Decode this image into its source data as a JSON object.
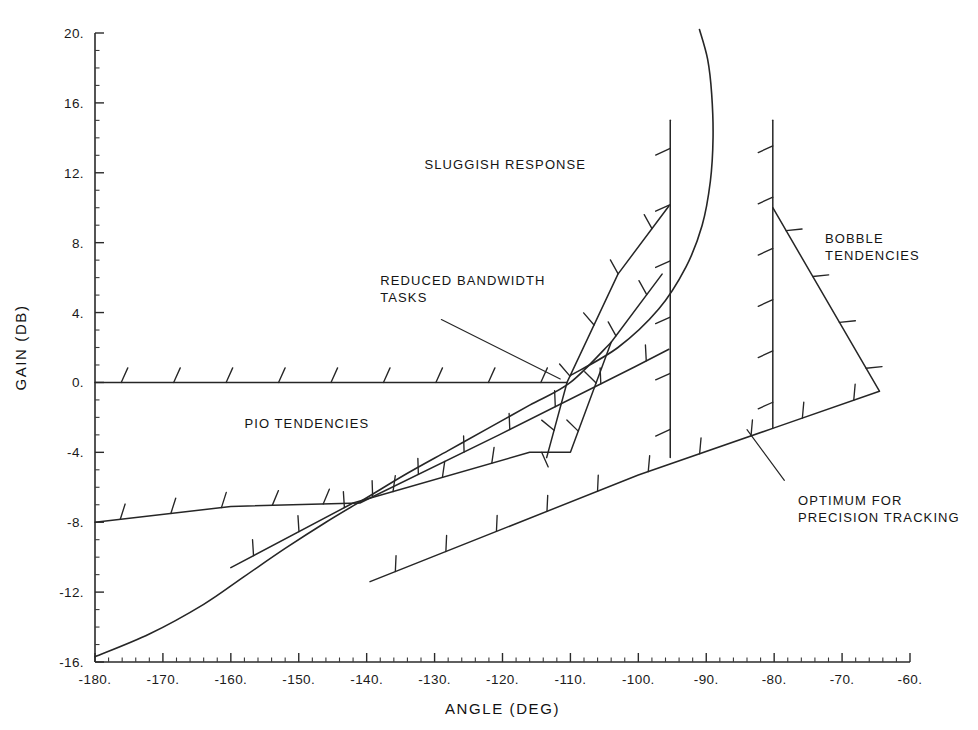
{
  "figure": {
    "background": "#ffffff",
    "ink_color": "#262626"
  },
  "chart_data": {
    "type": "line",
    "title": "",
    "subtitle": "",
    "xlabel": "ANGLE (DEG)",
    "ylabel": "GAIN (DB)",
    "xlim": [
      -180,
      -60
    ],
    "ylim": [
      -16,
      20
    ],
    "grid": false,
    "legend_position": "none",
    "x_tick_labels": [
      "-180.",
      "-170.",
      "-160.",
      "-150.",
      "-140.",
      "-130.",
      "-120.",
      "-110.",
      "-100.",
      "-90.",
      "-80.",
      "-70.",
      "-60."
    ],
    "x_tick_values": [
      -180,
      -170,
      -160,
      -150,
      -140,
      -130,
      -120,
      -110,
      -100,
      -90,
      -80,
      -70,
      -60
    ],
    "x_minor_step": 2,
    "y_tick_labels": [
      "20.",
      "16.",
      "12.",
      "8.",
      "4.",
      "0.",
      "-4.",
      "-8.",
      "-12.",
      "-16."
    ],
    "y_tick_values": [
      20,
      16,
      12,
      8,
      4,
      0,
      -4,
      -8,
      -12,
      -16
    ],
    "y_minor_step": 1,
    "series": [
      {
        "name": "pio-upper-zero-db-boundary",
        "kind": "hatched-boundary",
        "hatch_side": "above",
        "points": [
          [
            -180,
            0
          ],
          [
            -110.5,
            0
          ]
        ]
      },
      {
        "name": "reduced-bandwidth-upper-boundary",
        "kind": "hatched-boundary",
        "hatch_side": "left",
        "points": [
          [
            -113.5,
            -4.3
          ],
          [
            -110.5,
            0.0
          ],
          [
            -103.0,
            6.2
          ],
          [
            -95.5,
            10.1
          ]
        ]
      },
      {
        "name": "reduced-bandwidth-lower-boundary",
        "kind": "hatched-boundary",
        "hatch_side": "left",
        "points": [
          [
            -160.0,
            -10.6
          ],
          [
            -142.0,
            -6.9
          ],
          [
            -116.0,
            -4.0
          ],
          [
            -110.0,
            -4.0
          ],
          [
            -104.0,
            2.3
          ],
          [
            -96.5,
            6.2
          ]
        ]
      },
      {
        "name": "pio-lower-boundary",
        "kind": "hatched-boundary",
        "hatch_side": "above",
        "points": [
          [
            -180,
            -8.0
          ],
          [
            -160.0,
            -7.1
          ],
          [
            -141.0,
            -6.9
          ],
          [
            -120.5,
            -3.0
          ],
          [
            -100.5,
            0.9
          ],
          [
            -95.5,
            1.9
          ]
        ]
      },
      {
        "name": "optimum-precision-tracking-boundary",
        "kind": "hatched-boundary",
        "hatch_side": "above",
        "points": [
          [
            -139.5,
            -11.4
          ],
          [
            -100.0,
            -5.3
          ],
          [
            -80.0,
            -2.6
          ],
          [
            -64.5,
            -0.5
          ]
        ]
      },
      {
        "name": "lower-left-smooth-boundary",
        "kind": "smooth",
        "points": [
          [
            -180,
            -15.7
          ],
          [
            -172,
            -14.4
          ],
          [
            -164,
            -12.7
          ],
          [
            -158,
            -11.1
          ],
          [
            -152,
            -9.5
          ],
          [
            -146,
            -8.0
          ],
          [
            -140,
            -6.6
          ],
          [
            -134,
            -5.2
          ],
          [
            -128,
            -3.9
          ],
          [
            -122,
            -2.6
          ],
          [
            -116,
            -1.3
          ],
          [
            -110,
            0.0
          ],
          [
            -104,
            2.3
          ]
        ]
      },
      {
        "name": "sluggish-response-right-smooth-boundary",
        "kind": "smooth",
        "points": [
          [
            -110.0,
            0.4
          ],
          [
            -103.0,
            2.0
          ],
          [
            -97.0,
            4.2
          ],
          [
            -93.0,
            6.6
          ],
          [
            -90.6,
            9.0
          ],
          [
            -89.4,
            11.5
          ],
          [
            -89.0,
            14.0
          ],
          [
            -89.2,
            16.5
          ],
          [
            -89.8,
            18.5
          ],
          [
            -91.0,
            20.2
          ]
        ]
      },
      {
        "name": "bobble-vertical-boundary-left",
        "kind": "hatched-boundary",
        "hatch_side": "left",
        "points": [
          [
            -95.3,
            15.0
          ],
          [
            -95.3,
            -4.3
          ]
        ]
      },
      {
        "name": "bobble-vertical-boundary-right",
        "kind": "hatched-boundary",
        "hatch_side": "left",
        "points": [
          [
            -80.2,
            15.0
          ],
          [
            -80.2,
            -2.6
          ]
        ]
      },
      {
        "name": "bobble-diagonal-boundary",
        "kind": "hatched-boundary",
        "hatch_side": "right",
        "points": [
          [
            -80.2,
            10.0
          ],
          [
            -64.5,
            -0.5
          ]
        ]
      }
    ],
    "annotations": [
      {
        "id": "sluggish-response",
        "lines": [
          "SLUGGISH RESPONSE"
        ],
        "x": -131.5,
        "y": 12.2,
        "anchor": "start",
        "leader": null
      },
      {
        "id": "reduced-bandwidth-tasks",
        "lines": [
          "REDUCED BANDWIDTH",
          "TASKS"
        ],
        "x": -138.0,
        "y": 5.6,
        "anchor": "start",
        "leader": [
          [
            -129.0,
            3.6
          ],
          [
            -111.5,
            0.2
          ]
        ]
      },
      {
        "id": "pio-tendencies",
        "lines": [
          "PIO TENDENCIES"
        ],
        "x": -158.0,
        "y": -2.6,
        "anchor": "start",
        "leader": null
      },
      {
        "id": "bobble-tendencies",
        "lines": [
          "BOBBLE",
          "TENDENCIES"
        ],
        "x": -72.5,
        "y": 8.0,
        "anchor": "start",
        "leader": null
      },
      {
        "id": "optimum-for-precision-tracking",
        "lines": [
          "OPTIMUM FOR",
          "PRECISION TRACKING"
        ],
        "x": -76.5,
        "y": -7.0,
        "anchor": "start",
        "leader": [
          [
            -78.5,
            -5.6
          ],
          [
            -84.0,
            -2.7
          ]
        ]
      }
    ]
  }
}
